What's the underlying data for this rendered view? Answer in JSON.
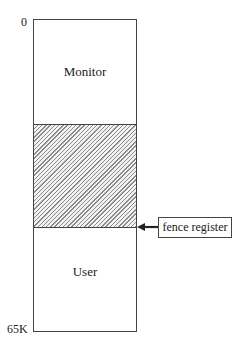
{
  "diagram": {
    "type": "memory-layout",
    "address_labels": {
      "start": "0",
      "end": "65K"
    },
    "regions": [
      {
        "id": "monitor",
        "label": "Monitor",
        "fill": "none"
      },
      {
        "id": "fence-area",
        "label": "",
        "fill": "hatched"
      },
      {
        "id": "user",
        "label": "User",
        "fill": "none"
      }
    ],
    "pointer": {
      "label": "fence register",
      "points_to": "boundary between hatched area and User"
    }
  }
}
